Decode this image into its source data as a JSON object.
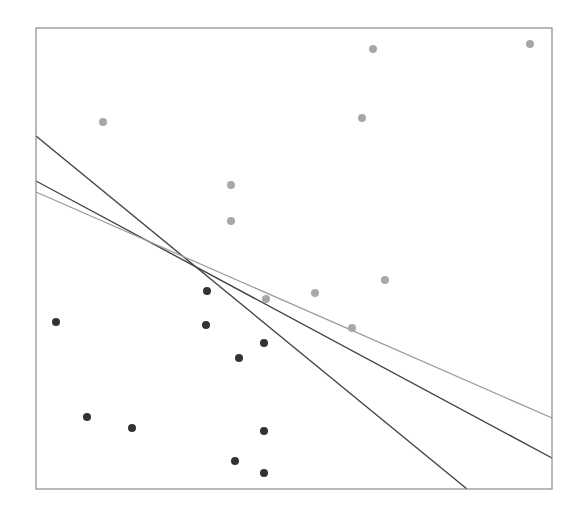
{
  "chart_data": {
    "type": "scatter",
    "title": "",
    "xlabel": "",
    "ylabel": "",
    "grid": false,
    "legend": null,
    "frame_px": {
      "x0": 36,
      "y0": 28,
      "x1": 552,
      "y1": 489
    },
    "xlim": [
      0,
      1
    ],
    "ylim": [
      0,
      1
    ],
    "series": [
      {
        "name": "class-1",
        "color": "#a8a8a8",
        "points_px": [
          [
            373,
            49
          ],
          [
            530,
            44
          ],
          [
            103,
            122
          ],
          [
            362,
            118
          ],
          [
            231,
            185
          ],
          [
            231,
            221
          ],
          [
            266,
            299
          ],
          [
            315,
            293
          ],
          [
            385,
            280
          ],
          [
            352,
            328
          ]
        ]
      },
      {
        "name": "class-0",
        "color": "#333333",
        "points_px": [
          [
            56,
            322
          ],
          [
            207,
            291
          ],
          [
            206,
            325
          ],
          [
            264,
            343
          ],
          [
            239,
            358
          ],
          [
            87,
            417
          ],
          [
            132,
            428
          ],
          [
            264,
            431
          ],
          [
            235,
            461
          ],
          [
            264,
            473
          ]
        ]
      }
    ],
    "lines": [
      {
        "name": "boundary-a",
        "color": "#444444",
        "width": 1.4,
        "from_px": [
          36,
          136
        ],
        "to_px": [
          467,
          489
        ]
      },
      {
        "name": "boundary-b",
        "color": "#444444",
        "width": 1.4,
        "from_px": [
          36,
          181
        ],
        "to_px": [
          552,
          458
        ]
      },
      {
        "name": "boundary-c",
        "color": "#9a9a9a",
        "width": 1.2,
        "from_px": [
          36,
          192
        ],
        "to_px": [
          552,
          418
        ]
      }
    ]
  }
}
